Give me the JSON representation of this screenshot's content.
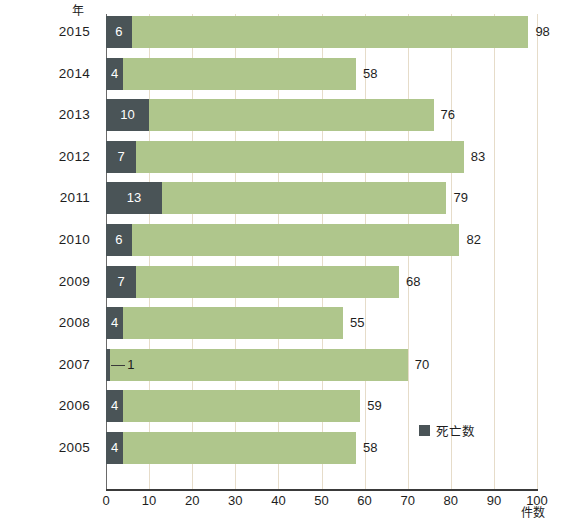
{
  "chart_data": {
    "type": "bar",
    "orientation": "horizontal",
    "stacked": true,
    "title": "",
    "xlabel": "件数",
    "ylabel": "年",
    "xlim": [
      0,
      100
    ],
    "xticks": [
      0,
      10,
      20,
      30,
      40,
      50,
      60,
      70,
      80,
      90,
      100
    ],
    "grid": true,
    "legend_position": "inside-right",
    "categories": [
      "2015",
      "2014",
      "2013",
      "2012",
      "2011",
      "2010",
      "2009",
      "2008",
      "2007",
      "2006",
      "2005"
    ],
    "series": [
      {
        "name": "死亡数",
        "color": "#4a5457",
        "values": [
          6,
          4,
          10,
          7,
          13,
          6,
          7,
          4,
          1,
          4,
          4
        ]
      },
      {
        "name": "",
        "color": "#afc68c",
        "values": [
          92,
          54,
          66,
          76,
          66,
          76,
          61,
          51,
          69,
          55,
          54
        ]
      }
    ],
    "totals": [
      98,
      58,
      76,
      83,
      79,
      82,
      68,
      55,
      70,
      59,
      58
    ]
  },
  "axes": {
    "y_unit": "年",
    "x_unit": "件数",
    "x_tick_labels": [
      "0",
      "10",
      "20",
      "30",
      "40",
      "50",
      "60",
      "70",
      "80",
      "90",
      "100"
    ]
  },
  "legend": {
    "items": [
      {
        "label": "死亡数",
        "color": "#4a5457"
      }
    ]
  },
  "rows": [
    {
      "year": "2015",
      "deaths": "6",
      "total": "98"
    },
    {
      "year": "2014",
      "deaths": "4",
      "total": "58"
    },
    {
      "year": "2013",
      "deaths": "10",
      "total": "76"
    },
    {
      "year": "2012",
      "deaths": "7",
      "total": "83"
    },
    {
      "year": "2011",
      "deaths": "13",
      "total": "79"
    },
    {
      "year": "2010",
      "deaths": "6",
      "total": "82"
    },
    {
      "year": "2009",
      "deaths": "7",
      "total": "68"
    },
    {
      "year": "2008",
      "deaths": "4",
      "total": "55"
    },
    {
      "year": "2007",
      "deaths": "1",
      "total": "70"
    },
    {
      "year": "2006",
      "deaths": "4",
      "total": "59"
    },
    {
      "year": "2005",
      "deaths": "4",
      "total": "58"
    }
  ],
  "colors": {
    "deaths": "#4a5457",
    "cases": "#afc68c",
    "gridline": "#e6dcc9",
    "axis": "#3a3a3a"
  }
}
